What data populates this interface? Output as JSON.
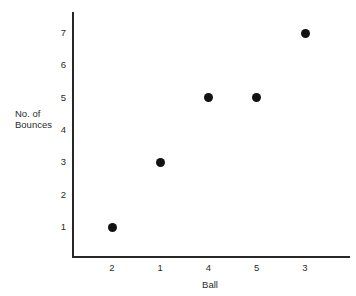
{
  "chart_data": {
    "type": "scatter",
    "title": "",
    "xlabel": "Ball",
    "ylabel": "No. of Bounces",
    "ylabel_lines": [
      "No. of",
      "Bounces"
    ],
    "categories": [
      "2",
      "1",
      "4",
      "5",
      "3"
    ],
    "x_tick_labels": [
      "2",
      "1",
      "4",
      "5",
      "3"
    ],
    "y_tick_labels": [
      "1",
      "2",
      "3",
      "4",
      "5",
      "6",
      "7"
    ],
    "ylim": [
      0,
      7.6
    ],
    "grid": false,
    "legend": "none",
    "marker": "filled-circle",
    "marker_color": "#121212",
    "axis_color": "#272727",
    "background_color": "#ffffff",
    "points": [
      {
        "ball": "2",
        "bounces": 1
      },
      {
        "ball": "1",
        "bounces": 3
      },
      {
        "ball": "4",
        "bounces": 5
      },
      {
        "ball": "5",
        "bounces": 5
      },
      {
        "ball": "3",
        "bounces": 7
      }
    ],
    "values": [
      1,
      3,
      5,
      5,
      7
    ]
  }
}
